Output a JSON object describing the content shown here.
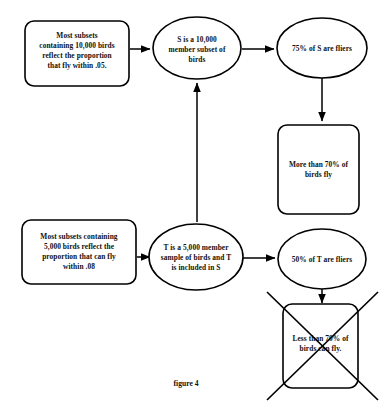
{
  "figure": {
    "caption": "figure 4",
    "caption_x": 186,
    "caption_y": 386
  },
  "nodes": {
    "premise_10000": {
      "shape": "rounded-rectangle",
      "lines": [
        "Most subsets",
        "containing 10,000 birds",
        "reflect the proportion",
        "that fly within .05."
      ],
      "x": 25,
      "y": 21,
      "width": 104,
      "height": 65
    },
    "set_s": {
      "shape": "ellipse",
      "lines": [
        "S is a 10,000",
        "member subset of",
        "birds"
      ],
      "cx": 197,
      "cy": 48,
      "rx": 44,
      "ry": 31
    },
    "s_fliers": {
      "shape": "ellipse",
      "lines": [
        "75% of S are fliers"
      ],
      "cx": 322,
      "cy": 48,
      "rx": 45,
      "ry": 30
    },
    "more_than_70": {
      "shape": "rounded-rectangle",
      "lines": [
        "More than 70% of",
        "birds fly"
      ],
      "x": 278,
      "y": 125,
      "width": 81,
      "height": 89
    },
    "premise_5000": {
      "shape": "rounded-rectangle",
      "lines": [
        "Most subsets containing",
        "5,000 birds reflect the",
        "proportion that can fly",
        "within .08"
      ],
      "x": 22,
      "y": 220,
      "width": 114,
      "height": 64
    },
    "sample_t": {
      "shape": "ellipse",
      "lines": [
        "T is a 5,000 member",
        "sample of birds and T",
        "is included in S"
      ],
      "cx": 196,
      "cy": 257,
      "rx": 47,
      "ry": 33
    },
    "t_fliers": {
      "shape": "ellipse",
      "lines": [
        "50% of T are fliers"
      ],
      "cx": 322,
      "cy": 259,
      "rx": 44,
      "ry": 30
    },
    "less_than_70": {
      "shape": "rounded-rectangle-struck",
      "lines": [
        "Less than 70% of",
        "birds can fly."
      ],
      "x": 283,
      "y": 304,
      "width": 75,
      "height": 84,
      "struck_out": true
    }
  },
  "edges": [
    {
      "name": "premise10000-to-set-s",
      "from": "premise_10000",
      "to": "set_s",
      "direction": "right",
      "x1": 130,
      "y1": 49,
      "x2": 152,
      "y2": 49
    },
    {
      "name": "set-s-to-s-fliers",
      "from": "set_s",
      "to": "s_fliers",
      "direction": "right",
      "x1": 242,
      "y1": 49,
      "x2": 276,
      "y2": 49
    },
    {
      "name": "s-fliers-to-more-than-70",
      "from": "s_fliers",
      "to": "more_than_70",
      "direction": "down",
      "x1": 322,
      "y1": 78,
      "x2": 322,
      "y2": 122
    },
    {
      "name": "sample-t-to-set-s",
      "from": "sample_t",
      "to": "set_s",
      "direction": "up",
      "x1": 197,
      "y1": 222,
      "x2": 197,
      "y2": 82
    },
    {
      "name": "premise5000-to-sample-t",
      "from": "premise_5000",
      "to": "sample_t",
      "direction": "right",
      "x1": 137,
      "y1": 257,
      "x2": 148,
      "y2": 257
    },
    {
      "name": "sample-t-to-t-fliers",
      "from": "sample_t",
      "to": "t_fliers",
      "direction": "right",
      "x1": 243,
      "y1": 258,
      "x2": 276,
      "y2": 258
    },
    {
      "name": "t-fliers-to-less-than-70",
      "from": "t_fliers",
      "to": "less_than_70",
      "direction": "down",
      "x1": 322,
      "y1": 289,
      "x2": 322,
      "y2": 301
    }
  ],
  "strikeout": {
    "name": "less-than-70-strikeout",
    "lines": [
      {
        "x1": 267,
        "y1": 292,
        "x2": 378,
        "y2": 400
      },
      {
        "x1": 378,
        "y1": 292,
        "x2": 267,
        "y2": 400
      }
    ]
  },
  "colors": {
    "stroke": "#000000",
    "fill": "#ffffff",
    "text": "#111111"
  }
}
